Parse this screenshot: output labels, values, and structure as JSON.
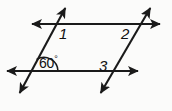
{
  "figure": {
    "background_color": "#fbfbfa",
    "stroke_color": "#1a1a1a",
    "labels": {
      "angle_1": "1",
      "angle_2": "2",
      "angle_3": "3",
      "angle_measure_value": "60",
      "angle_measure_symbol": "°",
      "angle_measure_full": "60°"
    },
    "lines": [
      {
        "name": "upper-horizontal-line",
        "kind": "double-arrow-line",
        "x1": 27,
        "y1": 24,
        "x2": 165,
        "y2": 24
      },
      {
        "name": "lower-horizontal-line",
        "kind": "double-arrow-line",
        "x1": 2,
        "y1": 71,
        "x2": 143,
        "y2": 71
      },
      {
        "name": "left-transversal-line",
        "kind": "double-arrow-line",
        "x1": 68,
        "y1": 3,
        "x2": 17,
        "y2": 98
      },
      {
        "name": "right-transversal-line",
        "kind": "double-arrow-line",
        "x1": 153,
        "y1": 3,
        "x2": 98,
        "y2": 98
      }
    ],
    "angle_arc": {
      "name": "sixty-degree-arc",
      "vertex_x": 44,
      "vertex_y": 71,
      "radius": 14
    }
  }
}
